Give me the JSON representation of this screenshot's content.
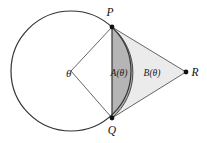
{
  "figure": {
    "type": "geometry-diagram",
    "background_color": "#ffffff",
    "stroke_color": "#333333",
    "labels": {
      "point_p": "P",
      "point_q": "Q",
      "point_r": "R",
      "angle_theta": "θ",
      "region_a": "A(θ)",
      "region_b": "B(θ)"
    },
    "colors": {
      "circle_stroke": "#333333",
      "chord_stroke": "#333333",
      "segment_a_fill": "#b5b5b5",
      "region_b_fill": "#ebebeb",
      "point_fill": "#111111",
      "thin_line": "#555555"
    },
    "geometry": {
      "circle_center_x": 71,
      "circle_center_y": 71,
      "circle_radius": 60,
      "point_p_x": 112,
      "point_p_y": 27,
      "point_q_x": 112,
      "point_q_y": 118,
      "point_r_x": 186,
      "point_r_y": 72,
      "arc_apex_x": 131,
      "arc_apex_y": 72,
      "dot_radius": 2.4
    }
  }
}
